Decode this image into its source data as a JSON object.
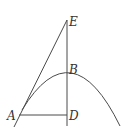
{
  "figure": {
    "type": "geometry-diagram",
    "points": {
      "A": {
        "label": "A",
        "x": 19,
        "y": 115
      },
      "B": {
        "label": "B",
        "x": 67,
        "y": 71
      },
      "D": {
        "label": "D",
        "x": 67,
        "y": 115
      },
      "E": {
        "label": "E",
        "x": 67,
        "y": 20
      }
    },
    "segments": [
      {
        "name": "AD",
        "from": "A",
        "to": "D"
      },
      {
        "name": "ED",
        "from": "E",
        "to": "D",
        "extended": true
      },
      {
        "name": "EA",
        "from": "E",
        "to": "A",
        "extended": true
      }
    ],
    "curve": {
      "type": "parabola",
      "opens": "down",
      "passes_through": [
        "A",
        "B"
      ]
    },
    "colors": {
      "stroke": "#4a4a4a",
      "label": "#333333",
      "background": "#ffffff"
    }
  }
}
